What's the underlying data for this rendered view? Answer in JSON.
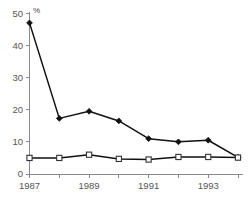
{
  "chart_data": {
    "type": "line",
    "title": "",
    "subtitle": "",
    "xlabel": "",
    "ylabel": "",
    "unit_label": "%",
    "x": [
      1987,
      1988,
      1989,
      1990,
      1991,
      1992,
      1993,
      1994
    ],
    "categories": [
      "1987",
      "1988",
      "1989",
      "1990",
      "1991",
      "1992",
      "1993",
      "1994"
    ],
    "xtick_labels": [
      "1987",
      "",
      "1989",
      "",
      "1991",
      "",
      "1993",
      ""
    ],
    "ytick_labels": [
      "0",
      "10",
      "20",
      "30",
      "40",
      "50"
    ],
    "ytick_values": [
      0,
      10,
      20,
      30,
      40,
      50
    ],
    "xlim": [
      1987,
      1994
    ],
    "ylim": [
      0,
      50
    ],
    "grid": false,
    "legend": "none",
    "series": [
      {
        "name": "series-filled-diamond",
        "marker": "filled-diamond",
        "color": "#111111",
        "values": [
          47.0,
          17.3,
          19.5,
          16.5,
          11.0,
          10.0,
          10.5,
          5.2
        ]
      },
      {
        "name": "series-open-square",
        "marker": "open-square",
        "color": "#333333",
        "values": [
          5.0,
          5.0,
          6.0,
          4.7,
          4.5,
          5.3,
          5.3,
          5.1
        ]
      }
    ]
  },
  "axes": {
    "axis_color": "#8a8a8a",
    "label_color": "#555555"
  }
}
